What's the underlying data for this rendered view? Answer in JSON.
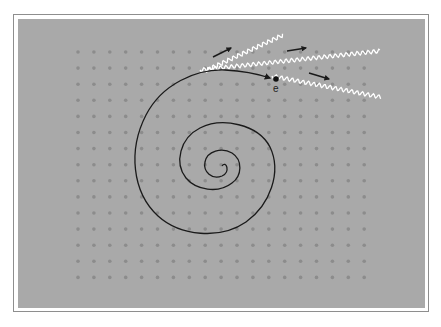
{
  "diagram": {
    "electron_label": "e",
    "colors": {
      "page_background": "#ffffff",
      "frame_border": "#8e8e8e",
      "panel_background": "#a9a9a9",
      "lattice_dot": "#8c8c8c",
      "trajectory": "#1a1a1a",
      "photon_wave": "#ffffff",
      "direction_arrow": "#1a1a1a",
      "electron": "#111111"
    },
    "lattice": {
      "columns": 19,
      "rows": 15,
      "origin_x": 78,
      "origin_y": 52,
      "spacing_x": 15.9,
      "spacing_y": 16.1,
      "dot_radius": 1.8
    },
    "electron_position": {
      "x": 276,
      "y": 79
    },
    "photons": [
      {
        "name": "photon-upper",
        "from": [
          205,
          71
        ],
        "to": [
          283,
          35
        ]
      },
      {
        "name": "photon-middle",
        "from": [
          200,
          70
        ],
        "to": [
          380,
          51
        ]
      },
      {
        "name": "photon-lower",
        "from": [
          272,
          76
        ],
        "to": [
          380,
          97
        ]
      }
    ],
    "arrows": [
      {
        "name": "arrow-upper",
        "from": [
          213,
          57
        ],
        "to": [
          231,
          48
        ]
      },
      {
        "name": "arrow-middle",
        "from": [
          287,
          51
        ],
        "to": [
          306,
          48
        ]
      },
      {
        "name": "arrow-lower",
        "from": [
          309,
          73
        ],
        "to": [
          329,
          79
        ]
      }
    ]
  }
}
